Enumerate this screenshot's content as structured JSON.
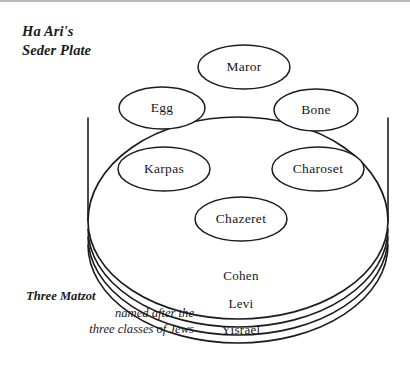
{
  "figure": {
    "title_lines": [
      "Ha Ari's",
      "Seder Plate"
    ],
    "caption": {
      "strong": "Three Matzot",
      "lines": [
        "named after the",
        "three classes of Jews"
      ]
    },
    "plate_items": [
      {
        "name": "maror",
        "label": "Maror",
        "cx": 244,
        "cy": 67,
        "rx": 46,
        "ry": 22
      },
      {
        "name": "egg",
        "label": "Egg",
        "cx": 162,
        "cy": 108,
        "rx": 43,
        "ry": 21
      },
      {
        "name": "bone",
        "label": "Bone",
        "cx": 316,
        "cy": 110,
        "rx": 42,
        "ry": 21
      },
      {
        "name": "karpas",
        "label": "Karpas",
        "cx": 164,
        "cy": 169,
        "rx": 46,
        "ry": 22
      },
      {
        "name": "charoset",
        "label": "Charoset",
        "cx": 318,
        "cy": 169,
        "rx": 46,
        "ry": 22
      },
      {
        "name": "chazeret",
        "label": "Chazeret",
        "cx": 241,
        "cy": 219,
        "rx": 46,
        "ry": 22
      }
    ],
    "matzot": [
      {
        "name": "cohen",
        "label": "Cohen",
        "y": 277
      },
      {
        "name": "levi",
        "label": "Levi",
        "y": 305
      },
      {
        "name": "yisrael",
        "label": "Yisrael",
        "y": 331
      }
    ],
    "colors": {
      "ink": "#1c1c1c",
      "paper": "#ffffff",
      "top_rule": "#b9b9b9"
    }
  }
}
